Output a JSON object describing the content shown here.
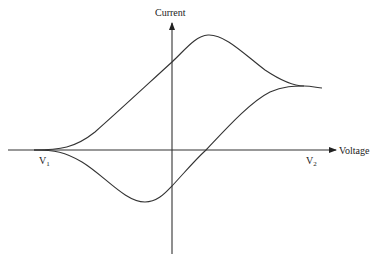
{
  "diagram": {
    "type": "cyclic-voltammogram",
    "y_axis_label": "Current",
    "x_axis_label": "Voltage",
    "markers": [
      {
        "label": "V",
        "subscript": "1"
      },
      {
        "label": "V",
        "subscript": "2"
      }
    ],
    "colors": {
      "line": "#333333",
      "background": "#ffffff"
    }
  }
}
